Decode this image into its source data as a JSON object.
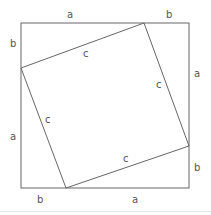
{
  "diagram": {
    "outer_square": {
      "x": 21,
      "y": 23,
      "size": 168,
      "stroke": "#666666"
    },
    "inner_square": {
      "points": [
        [
          144,
          23
        ],
        [
          189,
          146
        ],
        [
          66,
          188
        ],
        [
          21,
          68
        ]
      ],
      "stroke": "#666666"
    },
    "labels": {
      "top_a": "a",
      "top_b": "b",
      "left_b": "b",
      "left_a": "a",
      "right_a": "a",
      "right_b": "b",
      "bottom_b": "b",
      "bottom_a": "a",
      "inner_top_c": "c",
      "inner_right_c": "c",
      "inner_left_c": "c",
      "inner_bottom_c": "c"
    },
    "divider_color": "#e6e6e6"
  }
}
